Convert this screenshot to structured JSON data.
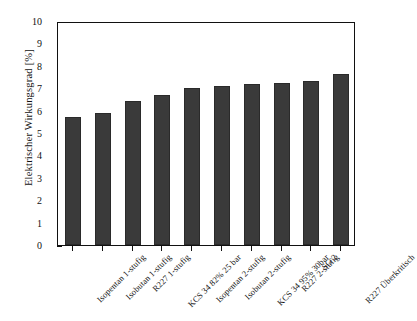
{
  "chart_data": {
    "type": "bar",
    "title": "",
    "xlabel": "",
    "ylabel": "Elektrischer Wirkungsgrad [%]",
    "ylim": [
      0,
      10
    ],
    "yticks": [
      "0",
      "1",
      "2",
      "3",
      "4",
      "5",
      "6",
      "7",
      "8",
      "9",
      "10"
    ],
    "grid": false,
    "legend": "none",
    "bar_color": "#3a3a3a",
    "categories": [
      "Isopentan 1-stufig",
      "Isobutan 1-stufig",
      "R227 1-stufig",
      "KCS 34 82% 25 bar",
      "Isopentan 2-stufig",
      "Isobutan 2-stufig",
      "KCS 34 95% 30bar",
      "R227 2-stufig",
      "SG 2",
      "R227 Überkritisch"
    ],
    "values": [
      5.7,
      5.9,
      6.45,
      6.7,
      7.0,
      7.1,
      7.2,
      7.25,
      7.3,
      7.65
    ]
  }
}
